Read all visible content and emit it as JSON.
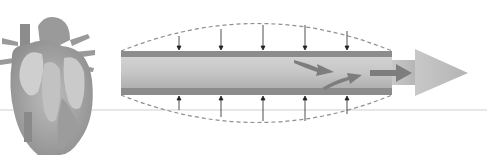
{
  "diagram": {
    "colors": {
      "background": "#ffffff",
      "heart_base": "#a8a8a8",
      "heart_dark": "#7a7a7a",
      "vessel_wall": "#8c8c8c",
      "vessel_lumen": "#c4c4c4",
      "dashed_outline": "#8a8a8a",
      "pressure_arrow": "#222222",
      "flow_arrow": "#7d7d7d",
      "big_arrow": "#bdbdbd",
      "baseline": "#cfcfcf"
    },
    "pressure_arrows_x": [
      179,
      221,
      263,
      305,
      347
    ],
    "elements": {
      "heart": "heart-illustration",
      "vessel": "blood-vessel-tube",
      "expansion": "dashed-expansion-outline",
      "flow": "blood-flow-arrows",
      "direction": "flow-direction-arrow"
    }
  }
}
